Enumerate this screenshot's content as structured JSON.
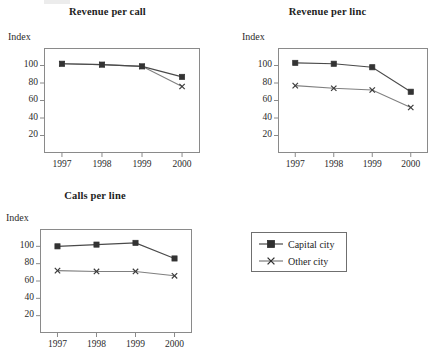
{
  "colors": {
    "ink": "#2b2b2b",
    "frame": "#8a8a8a",
    "series_capital": "#3a3a3a",
    "series_other": "#8c8c8c",
    "background": "#ffffff"
  },
  "legend": {
    "name": "chart-legend",
    "entries": [
      {
        "label": "Capital city",
        "marker": "filled-square-marker",
        "color": "#3a3a3a"
      },
      {
        "label": "Other city",
        "marker": "x-cross-marker",
        "color": "#7d7d7d"
      }
    ]
  },
  "axis_label": "Index",
  "chart_data": [
    {
      "id": "revenue-per-call",
      "type": "line",
      "title": "Revenue per call",
      "xlabel": "",
      "ylabel": "Index",
      "categories": [
        "1997",
        "1998",
        "1999",
        "2000"
      ],
      "yticks": [
        20,
        40,
        60,
        80,
        100
      ],
      "ylim": [
        0,
        120
      ],
      "grid": false,
      "legend_position": "external-bottom-right",
      "series": [
        {
          "name": "Capital city",
          "marker": "filled-square-marker",
          "values": [
            102,
            101,
            99,
            87
          ]
        },
        {
          "name": "Other city",
          "marker": "x-cross-marker",
          "values": [
            102,
            101,
            99,
            76
          ]
        }
      ],
      "annotations": [
        "Capital city and Other city series overlap from 1997 to 1999, then diverge in 2000"
      ]
    },
    {
      "id": "revenue-per-line",
      "type": "line",
      "title": "Revenue per linc",
      "xlabel": "",
      "ylabel": "Index",
      "categories": [
        "1997",
        "1998",
        "1999",
        "2000"
      ],
      "yticks": [
        20,
        40,
        60,
        80,
        100
      ],
      "ylim": [
        0,
        120
      ],
      "grid": false,
      "legend_position": "external-bottom-right",
      "series": [
        {
          "name": "Capital city",
          "marker": "filled-square-marker",
          "values": [
            103,
            102,
            98,
            70
          ]
        },
        {
          "name": "Other city",
          "marker": "x-cross-marker",
          "values": [
            77,
            74,
            72,
            52
          ]
        }
      ]
    },
    {
      "id": "calls-per-line",
      "type": "line",
      "title": "Calls per line",
      "xlabel": "",
      "ylabel": "Index",
      "categories": [
        "1997",
        "1998",
        "1999",
        "2000"
      ],
      "yticks": [
        20,
        40,
        60,
        80,
        100
      ],
      "ylim": [
        0,
        120
      ],
      "grid": false,
      "legend_position": "external-right",
      "series": [
        {
          "name": "Capital city",
          "marker": "filled-square-marker",
          "values": [
            100,
            102,
            104,
            86
          ]
        },
        {
          "name": "Other city",
          "marker": "x-cross-marker",
          "values": [
            72,
            71,
            71,
            66
          ]
        }
      ]
    }
  ]
}
